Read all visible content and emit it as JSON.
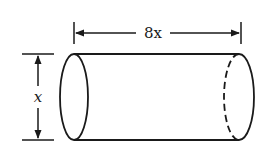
{
  "figure": {
    "shape": "cylinder",
    "length_label": "8x",
    "diameter_label": "x",
    "colors": {
      "stroke": "#1a1a1a",
      "background": "#ffffff"
    }
  }
}
